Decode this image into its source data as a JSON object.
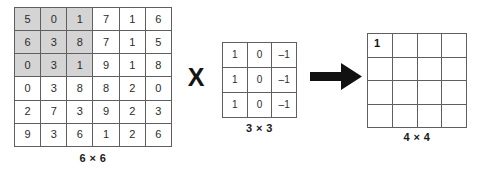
{
  "diagram": {
    "operators": {
      "multiply_symbol": "X",
      "arrow_icon": "arrow-right-icon"
    }
  },
  "input_matrix": {
    "caption": "6 × 6",
    "rows": 6,
    "cols": 6,
    "values": [
      [
        5,
        0,
        1,
        7,
        1,
        6
      ],
      [
        6,
        3,
        8,
        7,
        1,
        5
      ],
      [
        0,
        3,
        1,
        9,
        1,
        8
      ],
      [
        0,
        3,
        8,
        8,
        2,
        0
      ],
      [
        2,
        7,
        3,
        9,
        2,
        3
      ],
      [
        9,
        3,
        6,
        1,
        2,
        6
      ]
    ],
    "highlight": {
      "row_start": 0,
      "row_end": 2,
      "col_start": 0,
      "col_end": 2,
      "color": "#d4d4d4"
    }
  },
  "kernel_matrix": {
    "caption": "3 × 3",
    "rows": 3,
    "cols": 3,
    "values": [
      [
        "1",
        "0",
        "–1"
      ],
      [
        "1",
        "0",
        "–1"
      ],
      [
        "1",
        "0",
        "–1"
      ]
    ]
  },
  "output_matrix": {
    "caption": "4 × 4",
    "rows": 4,
    "cols": 4,
    "values": [
      [
        "1",
        "",
        "",
        ""
      ],
      [
        "",
        "",
        "",
        ""
      ],
      [
        "",
        "",
        "",
        ""
      ],
      [
        "",
        "",
        "",
        ""
      ]
    ]
  },
  "colors": {
    "grid_line": "#5f5f5f",
    "text": "#2b2b2b",
    "shade": "#d4d4d4",
    "arrow": "#111111",
    "background": "#ffffff"
  }
}
